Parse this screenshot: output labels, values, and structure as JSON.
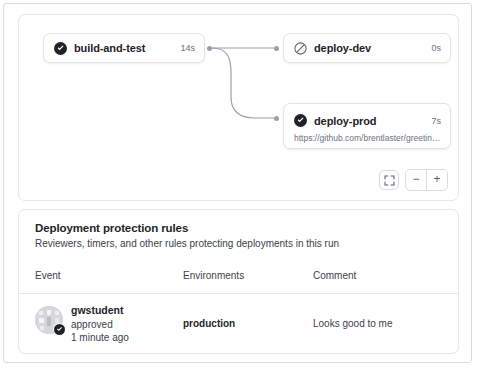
{
  "graph": {
    "nodes": [
      {
        "id": "build-and-test",
        "name": "build-and-test",
        "duration": "14s",
        "status": "success",
        "status_icon": "check-circle-fill-icon",
        "subtitle": ""
      },
      {
        "id": "deploy-dev",
        "name": "deploy-dev",
        "duration": "0s",
        "status": "skipped",
        "status_icon": "skip-circle-icon",
        "subtitle": ""
      },
      {
        "id": "deploy-prod",
        "name": "deploy-prod",
        "duration": "7s",
        "status": "success",
        "status_icon": "check-circle-fill-icon",
        "subtitle": "https://github.com/brentlaster/greeting…"
      }
    ],
    "edges": [
      {
        "from": "build-and-test",
        "to": "deploy-dev"
      },
      {
        "from": "build-and-test",
        "to": "deploy-prod"
      }
    ],
    "controls": {
      "fit_label": "",
      "fit_icon": "fit-screen-icon",
      "zoom_out_label": "−",
      "zoom_in_label": "+"
    }
  },
  "rules": {
    "title": "Deployment protection rules",
    "subtitle": "Reviewers, timers, and other rules protecting deployments in this run",
    "columns": {
      "event": "Event",
      "environments": "Environments",
      "comment": "Comment"
    },
    "rows": [
      {
        "avatar_alt": "gwstudent",
        "badge_icon": "check-circle-fill-icon",
        "user": "gwstudent",
        "action": "approved",
        "time": "1 minute ago",
        "environment": "production",
        "comment": "Looks good to me"
      }
    ]
  },
  "colors": {
    "success": "#1f2328",
    "muted": "#6b7280",
    "border": "#e1e4e8",
    "edge": "#9aa0a6"
  }
}
